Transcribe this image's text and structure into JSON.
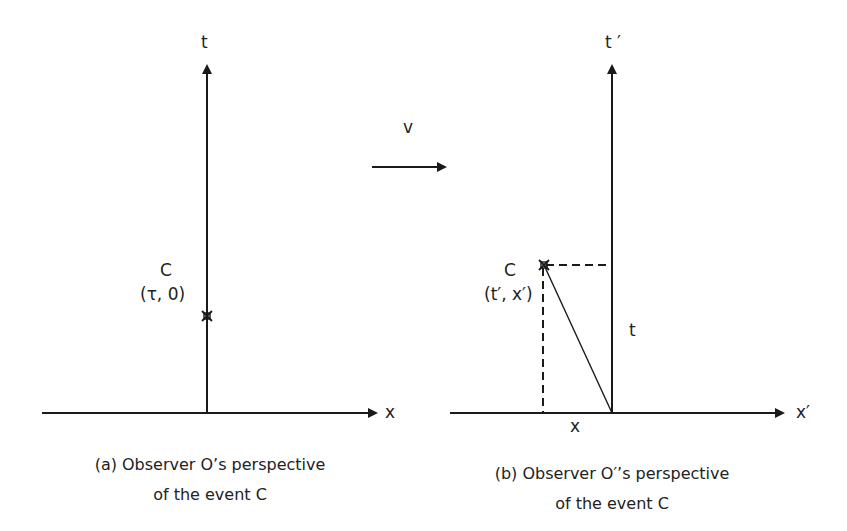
{
  "colors": {
    "stroke": "#1a1a1a",
    "background": "#ffffff"
  },
  "motion": {
    "label": "v"
  },
  "panel_a": {
    "t_axis_label": "t",
    "x_axis_label": "x",
    "event_name": "C",
    "event_coords": "(τ, 0)",
    "caption_line1": "(a) Observer O’s perspective",
    "caption_line2": "of the event C"
  },
  "panel_b": {
    "t_axis_label": "t ′",
    "x_axis_label": "x′",
    "event_name": "C",
    "event_coords": "(t′, x′)",
    "t_projection_label": "t",
    "x_projection_label": "x",
    "caption_line1": "(b) Observer O′’s perspective",
    "caption_line2": "of the event C"
  }
}
